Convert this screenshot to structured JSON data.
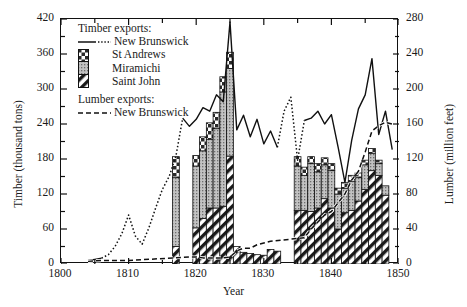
{
  "chart_data": {
    "type": "bar",
    "title": "",
    "xlabel": "Year",
    "ylabel": "Timber (thousand tons)",
    "ylabel_right": "Lumber (million feet)",
    "xlim": [
      1800,
      1850
    ],
    "ylim": [
      0,
      420
    ],
    "ylim_right": [
      0,
      280
    ],
    "xticks": [
      1800,
      1810,
      1820,
      1830,
      1840,
      1850
    ],
    "yticks": [
      0,
      60,
      120,
      180,
      240,
      300,
      360,
      420
    ],
    "yticks_right": [
      0,
      40,
      80,
      120,
      160,
      200,
      240,
      280
    ],
    "minor_ytick_step": 30,
    "minor_xtick_step": 5,
    "grid": false,
    "legend_position": "upper-left",
    "categories": [
      1817,
      1818,
      1819,
      1820,
      1821,
      1822,
      1823,
      1824,
      1825,
      1826,
      1827,
      1828,
      1829,
      1830,
      1831,
      1832,
      1835,
      1836,
      1837,
      1838,
      1839,
      1840,
      1841,
      1842,
      1843,
      1844,
      1845,
      1846,
      1847,
      1848
    ],
    "series": [
      {
        "name": "Saint John",
        "pattern": "diagonal-hatch",
        "values": [
          30,
          0,
          0,
          62,
          78,
          96,
          96,
          99,
          185,
          30,
          20,
          18,
          16,
          15,
          25,
          22,
          92,
          92,
          90,
          96,
          112,
          96,
          60,
          88,
          92,
          108,
          128,
          160,
          152,
          118
        ]
      },
      {
        "name": "Miramichi",
        "pattern": "gray-dotted",
        "values": [
          118,
          0,
          0,
          106,
          116,
          118,
          136,
          196,
          150,
          0,
          0,
          0,
          0,
          0,
          0,
          0,
          76,
          60,
          82,
          62,
          58,
          64,
          60,
          42,
          50,
          40,
          42,
          30,
          20,
          16
        ]
      },
      {
        "name": "St Andrews",
        "pattern": "checkered",
        "values": [
          36,
          0,
          0,
          18,
          24,
          28,
          28,
          26,
          28,
          0,
          0,
          0,
          0,
          0,
          0,
          0,
          16,
          14,
          12,
          14,
          12,
          12,
          10,
          10,
          10,
          8,
          8,
          8,
          6,
          0
        ]
      }
    ],
    "lines": [
      {
        "name": "Timber exports: New Brunswick",
        "style": "solid-with-dotted-gaps",
        "axis": "left",
        "x": [
          1804,
          1805,
          1806,
          1807,
          1808,
          1809,
          1810,
          1811,
          1812,
          1813,
          1814,
          1815,
          1816,
          1817,
          1818,
          1819,
          1820,
          1821,
          1822,
          1823,
          1824,
          1825,
          1826,
          1827,
          1828,
          1829,
          1830,
          1831,
          1832,
          1833,
          1834,
          1835,
          1836,
          1837,
          1838,
          1839,
          1840,
          1841,
          1842,
          1843,
          1844,
          1845,
          1846,
          1847,
          1848,
          1849
        ],
        "y": [
          6,
          8,
          10,
          16,
          30,
          52,
          84,
          48,
          34,
          62,
          96,
          128,
          150,
          185,
          250,
          236,
          248,
          268,
          262,
          290,
          278,
          415,
          230,
          255,
          218,
          248,
          206,
          228,
          200,
          262,
          286,
          178,
          246,
          250,
          262,
          240,
          256,
          200,
          140,
          212,
          266,
          290,
          352,
          222,
          262,
          196
        ]
      },
      {
        "name": "Lumber exports: New Brunswick",
        "style": "dashed",
        "axis": "right",
        "x": [
          1804,
          1806,
          1808,
          1810,
          1819,
          1820,
          1821,
          1822,
          1823,
          1824,
          1825,
          1826,
          1827,
          1828,
          1829,
          1830,
          1831,
          1836,
          1837,
          1838,
          1839,
          1840,
          1841,
          1842,
          1843,
          1844,
          1845,
          1846,
          1847,
          1848,
          1849
        ],
        "y": [
          3,
          4,
          4,
          4,
          8,
          8,
          7,
          7,
          7,
          7,
          8,
          15,
          18,
          18,
          22,
          24,
          26,
          30,
          40,
          48,
          56,
          60,
          70,
          80,
          96,
          106,
          128,
          152,
          158,
          162,
          160
        ]
      }
    ],
    "annotations": []
  },
  "legend": {
    "timber_header": "Timber exports:",
    "timber_line_label": "New Brunswick",
    "bar_labels": [
      "St Andrews",
      "Miramichi",
      "Saint John"
    ],
    "lumber_header": "Lumber exports:",
    "lumber_line_label": "New Brunswick"
  },
  "axes": {
    "left_title": "Timber (thousand tons)",
    "right_title": "Lumber (million feet)",
    "x_title": "Year",
    "left_ticklabels": [
      "420",
      "360",
      "300",
      "240",
      "180",
      "120",
      "60",
      "0"
    ],
    "right_ticklabels": [
      "280",
      "240",
      "200",
      "160",
      "120",
      "80",
      "40",
      "0"
    ],
    "x_ticklabels": [
      "1800",
      "1810",
      "1820",
      "1830",
      "1840",
      "1850"
    ]
  },
  "colors": {
    "ink": "#111111",
    "bar_gray": "#b9b9b9",
    "hatch": "#1a1a1a"
  }
}
